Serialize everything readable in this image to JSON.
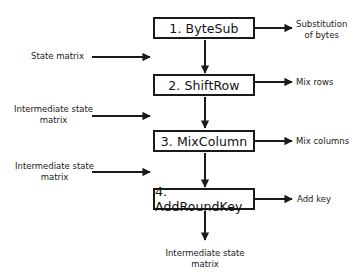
{
  "diagram": {
    "type": "flowchart",
    "steps": [
      {
        "label": "1. ByteSub",
        "output_label": "Substitution\nof bytes",
        "output_lines": [
          "Substitution",
          "of bytes"
        ]
      },
      {
        "label": "2. ShiftRow",
        "output_label": "Mix rows",
        "output_lines": [
          "Mix rows"
        ]
      },
      {
        "label": "3. MixColumn",
        "output_label": "Mix columns",
        "output_lines": [
          "Mix columns"
        ]
      },
      {
        "label": "4. AddRoundKey",
        "output_label": "Add key",
        "output_lines": [
          "Add key"
        ]
      }
    ],
    "inputs": [
      {
        "lines": [
          "State matrix"
        ]
      },
      {
        "lines": [
          "Intermediate state",
          "matrix"
        ]
      },
      {
        "lines": [
          "Intermediate state",
          "matrix"
        ]
      }
    ],
    "final_output": {
      "lines": [
        "Intermediate state",
        "matrix"
      ]
    },
    "colors": {
      "stroke": "#1a1a1a",
      "background": "#ffffff",
      "text": "#222222"
    }
  }
}
